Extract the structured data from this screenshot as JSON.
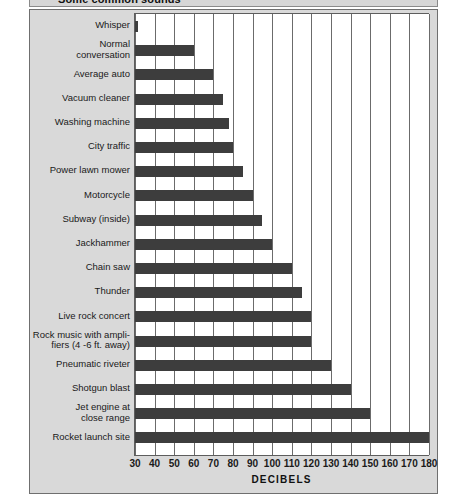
{
  "figure": {
    "title": "Some common sounds",
    "axis_title": "DECIBELS"
  },
  "chart_data": {
    "type": "bar",
    "orientation": "horizontal",
    "title": "Some common sounds",
    "xlabel": "DECIBELS",
    "ylabel": "",
    "xlim": [
      30,
      180
    ],
    "xticks": [
      30,
      40,
      50,
      60,
      70,
      80,
      90,
      100,
      110,
      120,
      130,
      140,
      150,
      160,
      170,
      180
    ],
    "xtick_labels": [
      "30",
      "40",
      "50",
      "60",
      "70",
      "80",
      "90",
      "100",
      "110",
      "120",
      "130",
      "140",
      "150",
      "160",
      "170",
      "180"
    ],
    "grid": "vertical",
    "legend": "none",
    "bar_color": "#3d3d3d",
    "categories": [
      "Whisper",
      "Normal\nconversation",
      "Average auto",
      "Vacuum cleaner",
      "Washing machine",
      "City traffic",
      "Power lawn mower",
      "Motorcycle",
      "Subway (inside)",
      "Jackhammer",
      "Chain saw",
      "Thunder",
      "Live rock concert",
      "Rock music with ampli-\nfiers (4 -6 ft. away)",
      "Pneumatic riveter",
      "Shotgun blast",
      "Jet engine at\nclose range",
      "Rocket launch site"
    ],
    "values": [
      30,
      60,
      70,
      75,
      78,
      80,
      85,
      90,
      95,
      100,
      110,
      115,
      120,
      120,
      130,
      140,
      150,
      180
    ]
  }
}
